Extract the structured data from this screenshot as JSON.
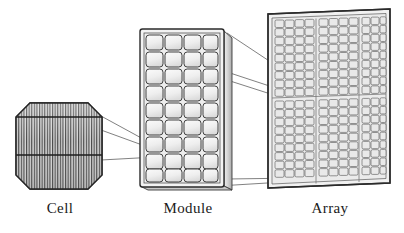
{
  "figure": {
    "background_color": "#ffffff",
    "line_color": "#2b2b2b",
    "fill_light": "#f2f2f2",
    "fill_mid": "#e2e2e2",
    "fill_shadow": "#c8c8c8"
  },
  "captions": {
    "cell": "Cell",
    "module": "Module",
    "array": "Array"
  },
  "cell": {
    "label": "Cell",
    "shape": "octagon-chamfered-square",
    "finger_count": 34,
    "busbar_count": 2,
    "bounds": {
      "x": 16,
      "y": 103,
      "w": 86,
      "h": 86
    },
    "chamfer": 14
  },
  "module": {
    "label": "Module",
    "columns": 4,
    "rows": 9,
    "cell_count": 36,
    "bounds": {
      "x": 140,
      "y": 28,
      "w": 84,
      "h": 160
    },
    "has_frame": true,
    "perspective": "right-side-edge-visible"
  },
  "array": {
    "label": "Array",
    "module_columns": 3,
    "module_rows": 2,
    "module_count": 6,
    "cells_per_module_columns": 4,
    "cells_per_module_rows": 9,
    "bounds": {
      "x": 262,
      "y": 10,
      "w": 128,
      "h": 178
    },
    "has_frame": true,
    "perspective": "tilted-left-edge-nearer"
  },
  "connectors": {
    "cell_to_module": {
      "count": 3,
      "from": "cell right edge",
      "to": "module cell row 7 column 1"
    },
    "module_to_array": {
      "count": 4,
      "from": "module right edge and corners",
      "to": "array top-left module region"
    }
  }
}
